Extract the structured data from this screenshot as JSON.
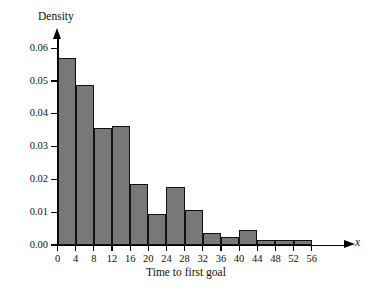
{
  "chart_data": {
    "type": "bar",
    "title": "",
    "subtitle": "",
    "xlabel": "Time to first goal",
    "ylabel": "Density",
    "x_var_symbol": "x",
    "xlim": [
      0,
      58
    ],
    "ylim": [
      0.0,
      0.063
    ],
    "grid": false,
    "legend": null,
    "x_tick_labels": [
      "0",
      "4",
      "8",
      "12",
      "16",
      "20",
      "24",
      "28",
      "32",
      "36",
      "40",
      "44",
      "48",
      "52",
      "56"
    ],
    "x_tick_values": [
      0,
      4,
      8,
      12,
      16,
      20,
      24,
      28,
      32,
      36,
      40,
      44,
      48,
      52,
      56
    ],
    "y_tick_labels": [
      "0.00",
      "0.01",
      "0.02",
      "0.03",
      "0.04",
      "0.05",
      "0.06"
    ],
    "y_tick_values": [
      0.0,
      0.01,
      0.02,
      0.03,
      0.04,
      0.05,
      0.06
    ],
    "bin_width": 4,
    "bin_edges": [
      0,
      4,
      8,
      12,
      16,
      20,
      24,
      28,
      32,
      36,
      40,
      44,
      48,
      52,
      56
    ],
    "categories": [
      "0-4",
      "4-8",
      "8-12",
      "12-16",
      "16-20",
      "20-24",
      "24-28",
      "28-32",
      "32-36",
      "36-40",
      "40-44",
      "44-48",
      "48-52",
      "52-56"
    ],
    "values": [
      0.057,
      0.0488,
      0.0356,
      0.0364,
      0.0187,
      0.0094,
      0.0177,
      0.0106,
      0.0036,
      0.0024,
      0.0045,
      0.0016,
      0.0016,
      0.0016
    ],
    "bar_fill_color": "#787878",
    "bar_edge_color": "#111111",
    "axis_color": "#000000",
    "background_color": "#ffffff"
  }
}
